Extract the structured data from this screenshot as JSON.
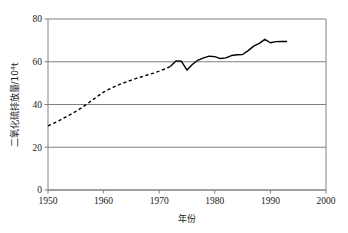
{
  "chart_data": {
    "type": "line",
    "title": "",
    "xlabel": "年份",
    "ylabel": "二氧化硫排放量/10⁴t",
    "ylabel_base": "二氧化硫排放量/10",
    "ylabel_exponent": "4",
    "ylabel_unit": "t",
    "xlim": [
      1950,
      2000
    ],
    "ylim": [
      0,
      80
    ],
    "xticks": [
      1950,
      1960,
      1970,
      1980,
      1990,
      2000
    ],
    "xtick_labels": [
      "1950",
      "1960",
      "1970",
      "1980",
      "1990",
      "2000"
    ],
    "yticks": [
      0,
      20,
      40,
      60,
      80
    ],
    "ytick_labels": [
      "0",
      "20",
      "40",
      "60",
      "80"
    ],
    "grid": "horizontal",
    "grid_color": "#808080",
    "legend": "none",
    "line_color": "#000000",
    "series": [
      {
        "name": "估算值",
        "style": "dashed",
        "x": [
          1950,
          1951,
          1952,
          1953,
          1954,
          1955,
          1956,
          1957,
          1958,
          1959,
          1960,
          1961,
          1962,
          1963,
          1964,
          1965,
          1966,
          1967,
          1968,
          1969,
          1970,
          1971,
          1972
        ],
        "values": [
          30.0,
          31.2,
          32.5,
          33.9,
          35.3,
          36.8,
          38.4,
          40.2,
          42.1,
          44.0,
          45.8,
          47.2,
          48.4,
          49.5,
          50.5,
          51.4,
          52.3,
          53.1,
          53.9,
          54.7,
          55.6,
          56.6,
          57.8
        ]
      },
      {
        "name": "实测值",
        "style": "solid",
        "x": [
          1972,
          1973,
          1974,
          1975,
          1976,
          1977,
          1978,
          1979,
          1980,
          1981,
          1982,
          1983,
          1984,
          1985,
          1986,
          1987,
          1988,
          1989,
          1990,
          1991,
          1992,
          1993
        ],
        "values": [
          57.8,
          60.4,
          60.2,
          56.1,
          58.8,
          60.8,
          61.8,
          62.6,
          62.4,
          61.5,
          61.8,
          62.9,
          63.3,
          63.4,
          65.2,
          67.3,
          68.6,
          70.5,
          68.9,
          69.4,
          69.5,
          69.5
        ]
      }
    ]
  }
}
